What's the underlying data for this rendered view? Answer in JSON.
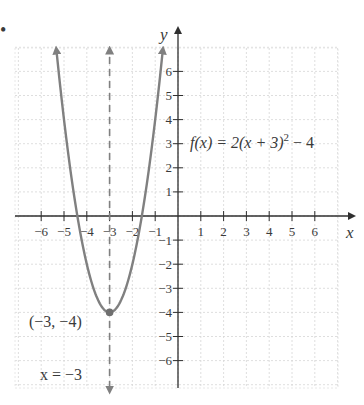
{
  "figure": {
    "bullet": "•"
  },
  "chart_data": {
    "type": "line",
    "title": "",
    "function_label": "f(x) = 2(x + 3)² − 4",
    "function_label_parts": {
      "lhs": "f(x) = 2(x + 3)",
      "exponent": "2",
      "rhs": " − 4"
    },
    "xlabel": "x",
    "ylabel": "y",
    "xlim": [
      -7,
      7
    ],
    "ylim": [
      -7,
      7
    ],
    "grid": true,
    "xticks": [
      -6,
      -5,
      -4,
      -3,
      -2,
      -1,
      1,
      2,
      3,
      4,
      5,
      6
    ],
    "yticks": [
      -6,
      -5,
      -4,
      -3,
      -2,
      -1,
      1,
      2,
      3,
      4,
      5,
      6
    ],
    "xtick_labels": [
      "−6",
      "−5",
      "−4",
      "−3",
      "−2",
      "−1",
      "1",
      "2",
      "3",
      "4",
      "5",
      "6"
    ],
    "ytick_labels": [
      "−6",
      "−5",
      "−4",
      "−3",
      "−2",
      "−1",
      "1",
      "2",
      "3",
      "4",
      "5",
      "6"
    ],
    "series": [
      {
        "name": "f(x) = 2(x + 3)^2 − 4",
        "color": "#808080",
        "x": [
          -5.96,
          -5.5,
          -5,
          -4.5,
          -4,
          -3.5,
          -3,
          -2.5,
          -2,
          -1.5,
          -1,
          -0.04
        ],
        "y": [
          13.5,
          8.5,
          4,
          0.5,
          -2,
          -3.5,
          -4,
          -3.5,
          -2,
          0.5,
          4,
          13.5
        ]
      }
    ],
    "axis_of_symmetry": {
      "x": -3,
      "label": "x = −3",
      "style": "dashed",
      "color": "#808080"
    },
    "vertex": {
      "x": -3,
      "y": -4,
      "label": "(−3, −4)"
    },
    "annotations": [
      {
        "text": "f(x) = 2(x + 3)² − 4",
        "x": 1.7,
        "y": 3
      },
      {
        "text": "(−3, −4)",
        "x": -5.8,
        "y": -4.5
      },
      {
        "text": "x = −3",
        "x": -5.8,
        "y": -6.7
      }
    ]
  }
}
